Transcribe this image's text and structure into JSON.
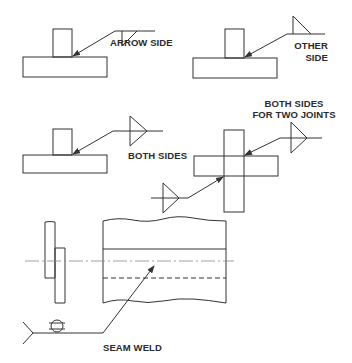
{
  "diagram": {
    "colors": {
      "line": "#333333",
      "thin_line": "#777777",
      "background": "#ffffff"
    },
    "panels": [
      {
        "id": "arrow-side",
        "joint": "tee",
        "symbol": "fillet",
        "placement": "below reference line",
        "label": "ARROW SIDE"
      },
      {
        "id": "other-side",
        "joint": "tee",
        "symbol": "fillet",
        "placement": "above reference line",
        "label_lines": [
          "OTHER",
          "SIDE"
        ]
      },
      {
        "id": "both-sides",
        "joint": "tee",
        "symbol": "fillet",
        "placement": "above and below reference line",
        "label": "BOTH SIDES"
      },
      {
        "id": "both-sides-two-joints",
        "joint": "cruciform",
        "symbol": "fillet",
        "placement": "both sides, two arrows",
        "label_lines": [
          "BOTH SIDES",
          "FOR TWO JOINTS"
        ]
      },
      {
        "id": "seam-weld",
        "joint": "lap (seam)",
        "symbol": "seam",
        "placement": "on reference line",
        "label": "SEAM WELD"
      }
    ]
  }
}
